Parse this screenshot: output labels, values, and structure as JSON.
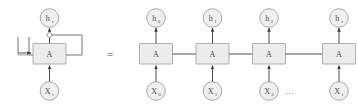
{
  "figure": {
    "equals_symbol": "=",
    "ellipsis": "...",
    "cell_label": "A",
    "colors": {
      "background": "#ffffff",
      "box_fill": "#ececec",
      "box_stroke": "#a8a8a8",
      "circle_fill": "#efefef",
      "circle_stroke": "#a0a0a0",
      "arrow": "#3a3a3a",
      "loop_line": "#8f8f8f",
      "text": "#4a4a4a"
    }
  },
  "folded": {
    "name": "folded-rnn-cell",
    "output": {
      "base": "h",
      "sub": "t"
    },
    "cell": {
      "label": "A"
    },
    "input": {
      "base": "X",
      "sub": "t"
    },
    "loop": {
      "label": "recurrent-self-loop"
    }
  },
  "unrolled": {
    "name": "unrolled-rnn-chain",
    "steps": [
      {
        "index": 0,
        "output": {
          "base": "h",
          "sub": "0"
        },
        "cell": {
          "label": "A"
        },
        "input": {
          "base": "X",
          "sub": "0"
        }
      },
      {
        "index": 1,
        "output": {
          "base": "h",
          "sub": "1"
        },
        "cell": {
          "label": "A"
        },
        "input": {
          "base": "X",
          "sub": "1"
        }
      },
      {
        "index": 2,
        "output": {
          "base": "h",
          "sub": "2"
        },
        "cell": {
          "label": "A"
        },
        "input": {
          "base": "X",
          "sub": "2"
        }
      },
      {
        "index": 3,
        "output": {
          "base": "h",
          "sub": "t"
        },
        "cell": {
          "label": "A"
        },
        "input": {
          "base": "X",
          "sub": "t"
        }
      }
    ]
  }
}
